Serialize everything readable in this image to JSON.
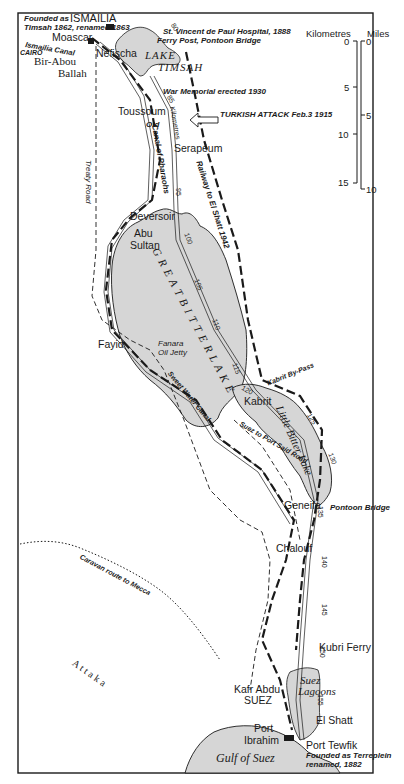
{
  "map": {
    "title": "Suez Canal: Ismailia to Port Tewfik",
    "scale_bar": {
      "units_left": "Kilometres",
      "units_right": "Miles",
      "km_ticks": [
        "0",
        "5",
        "10",
        "15"
      ],
      "mile_ticks": [
        "0",
        "5",
        "10"
      ]
    },
    "places": {
      "ismailia": "ISMAILIA",
      "moascar": "Moascar",
      "bir_abou": "Bir-Abou",
      "ballah": "Ballah",
      "nefischa": "Nefischa",
      "toussoum": "Toussoum",
      "serapeum": "Serapéum",
      "deversoir": "Deversoir",
      "abu": "Abu",
      "sultan": "Sultan",
      "fayid": "Fayid",
      "kabrit": "Kabrit",
      "geneifa": "Geneifa",
      "chalouf": "Chalouf",
      "kubri_ferry": "Kubri Ferry",
      "kafr_abdu": "Kafr Abdu",
      "suez": "SUEZ",
      "el_shatt": "El Shatt",
      "port": "Port",
      "ibrahim": "Ibrahim",
      "port_tewfik": "Port Tewfik",
      "attaka": "A t t a k a"
    },
    "water": {
      "lake_timsah_1": "LAKE",
      "lake_timsah_2": "TIMSAH",
      "great_bitter_lake": "G R E A T   B I T T E R   L A K E",
      "little_bitter_lake": "Little Bitter Lake",
      "suez_lagoons_1": "Suez",
      "suez_lagoons_2": "Lagoons",
      "gulf_of_suez": "Gulf of Suez"
    },
    "notes": {
      "founded_ismailia_1": "Founded as",
      "founded_ismailia_2": "Timsah 1862, renamed 1863",
      "st_vincent": "St. Vincent de Paul Hospital, 1888",
      "ferry_post": "Ferry Post, Pontoon Bridge",
      "ismailia_canal": "Ismailia Canal",
      "cairo": "CAIRO",
      "war_memorial": "War Memorial erected 1930",
      "turkish_attack": "TURKISH ATTACK Feb.3 1915",
      "old": "Old",
      "canal_pharaohs": "Canal of Pharaohs",
      "kilometres": "Kilometres",
      "railway_el_shatt": "Railway to El Shatt 1942",
      "treaty_road": "Treaty Road",
      "fanara_1": "Fanara",
      "fanara_2": "Oil Jetty",
      "sweet_water_canal": "Sweet Water Canal",
      "kabrit_bypass": "Kabrit By-Pass",
      "suez_port_said_road": "Suez to Port Said Road",
      "pontoon_bridge": "Pontoon Bridge",
      "caravan_route": "Caravan route to Mecca",
      "founded_tewfik_1": "Founded as Terreplein",
      "founded_tewfik_2": "renamed, 1882"
    },
    "km_markers": [
      "80",
      "85",
      "95",
      "100",
      "105",
      "110",
      "115",
      "120",
      "125",
      "130",
      "135",
      "140",
      "145",
      "150",
      "155"
    ],
    "colors": {
      "water": "#d6d6d6",
      "ink": "#1a1a1a",
      "paper": "#ffffff"
    }
  }
}
